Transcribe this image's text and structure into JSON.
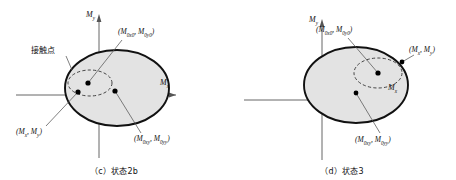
{
  "figure": {
    "background": "#ffffff",
    "stroke_color": "#1a1a1a",
    "ellipse_fill": "#e3e3e3",
    "dashed_stroke": "#333333",
    "marker_color": "#000000"
  },
  "panels": [
    {
      "id": "c",
      "caption": "（c）状态2b",
      "axes": {
        "x_label_M": "M",
        "x_label_sub": "x",
        "y_label_M": "M",
        "y_label_sub": "y"
      },
      "annotation": {
        "text": "接触点"
      },
      "labels": [
        {
          "name": "center-initial",
          "prefix": "(",
          "m1": "M",
          "m1_sub": "0x0",
          "sep": ", ",
          "m2": "M",
          "m2_sub": "0y0",
          "suffix": ")"
        },
        {
          "name": "contact-point",
          "prefix": "(",
          "m1": "M",
          "m1_sub": "x",
          "sep": ", ",
          "m2": "M",
          "m2_sub": "y",
          "suffix": ")"
        },
        {
          "name": "center-current",
          "prefix": "(",
          "m1": "M",
          "m1_sub": "0xy",
          "sep": ", ",
          "m2": "M",
          "m2_sub": "0yy",
          "suffix": ")"
        }
      ],
      "markers": [
        {
          "name": "dashed-ellipse-center",
          "x": 88,
          "y": 83
        },
        {
          "name": "contact-point-marker",
          "x": 78,
          "y": 92
        },
        {
          "name": "solid-ellipse-center",
          "x": 115,
          "y": 91
        }
      ],
      "solid_ellipse": {
        "cx": 117,
        "cy": 88,
        "rx": 52,
        "ry": 38
      },
      "dashed_ellipse": {
        "cx": 90,
        "cy": 83,
        "rx": 22,
        "ry": 13
      }
    },
    {
      "id": "d",
      "caption": "（d）状态3",
      "axes": {
        "x_label_M": "M",
        "x_label_sub": "x",
        "y_label_M": "M",
        "y_label_sub": "y"
      },
      "annotation": null,
      "labels": [
        {
          "name": "center-initial",
          "prefix": "(",
          "m1": "M",
          "m1_sub": "0x0",
          "sep": ", ",
          "m2": "M",
          "m2_sub": "0y0",
          "suffix": ")"
        },
        {
          "name": "contact-point",
          "prefix": "(",
          "m1": "M",
          "m1_sub": "x",
          "sep": ", ",
          "m2": "M",
          "m2_sub": "y",
          "suffix": ")"
        },
        {
          "name": "center-current",
          "prefix": "(",
          "m1": "M",
          "m1_sub": "0xy",
          "sep": ", ",
          "m2": "M",
          "m2_sub": "0yy",
          "suffix": ")"
        }
      ],
      "markers": [
        {
          "name": "dashed-ellipse-center",
          "x": 378,
          "y": 73
        },
        {
          "name": "solid-ellipse-center",
          "x": 356,
          "y": 93
        }
      ],
      "solid_ellipse": {
        "cx": 356,
        "cy": 85,
        "rx": 52,
        "ry": 38
      },
      "dashed_ellipse": {
        "cx": 378,
        "cy": 73,
        "rx": 24,
        "ry": 15
      }
    }
  ]
}
